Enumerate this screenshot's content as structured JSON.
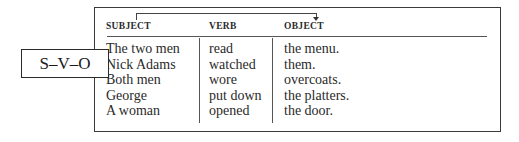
{
  "label": "S–V–O",
  "headers": {
    "subject": "SUBJECT",
    "verb": "VERB",
    "object": "OBJECT"
  },
  "rows": [
    {
      "subject": "The two men",
      "verb": "read",
      "object": "the menu."
    },
    {
      "subject": "Nick Adams",
      "verb": "watched",
      "object": "them."
    },
    {
      "subject": "Both men",
      "verb": "wore",
      "object": "overcoats."
    },
    {
      "subject": "George",
      "verb": "put down",
      "object": "the platters."
    },
    {
      "subject": "A woman",
      "verb": "opened",
      "object": "the door."
    }
  ]
}
